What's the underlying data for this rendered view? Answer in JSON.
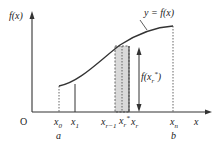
{
  "diagram": {
    "type": "riemann-sum-illustration",
    "y_axis_label": "f(x)",
    "x_axis_label": "x",
    "origin_label": "O",
    "curve_label": "y = f(x)",
    "height_label": "f(x_r*)",
    "x_ticks": [
      {
        "label": "x",
        "sub": "0",
        "below": "a"
      },
      {
        "label": "x",
        "sub": "1",
        "below": ""
      },
      {
        "label": "x",
        "sub": "r−1",
        "below": ""
      },
      {
        "label": "x",
        "sub": "r",
        "sup": "*",
        "below": ""
      },
      {
        "label": "x",
        "sub": "r",
        "below": ""
      },
      {
        "label": "x",
        "sub": "n",
        "below": "b"
      }
    ],
    "colors": {
      "line": "#222222",
      "shade": "#d9d9d9",
      "dotted": "#555555"
    }
  }
}
